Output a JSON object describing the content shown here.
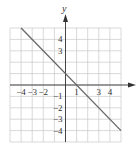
{
  "chart_data": {
    "type": "line",
    "title": "",
    "xlabel": "x",
    "ylabel": "y",
    "xlim": [
      -5,
      5
    ],
    "ylim": [
      -5,
      5
    ],
    "grid": true,
    "x_tick_labels": [
      "-4",
      "-3",
      "-2",
      "1",
      "3",
      "4"
    ],
    "x_tick_values": [
      -4,
      -3,
      -2,
      1,
      3,
      4
    ],
    "y_tick_labels": [
      "4",
      "3",
      "-1",
      "-2",
      "-3",
      "-4"
    ],
    "y_tick_values": [
      4,
      3,
      -1,
      -2,
      -3,
      -4
    ],
    "series": [
      {
        "name": "y = -x + 1",
        "equation": "y = -x + 1",
        "x": [
          -4,
          5
        ],
        "y": [
          5,
          -4
        ]
      }
    ]
  },
  "colors": {
    "grid": "#c8c8c8",
    "axis": "#333333",
    "line": "#666666",
    "background": "#ffffff"
  },
  "labels": {
    "y_axis": "y"
  }
}
